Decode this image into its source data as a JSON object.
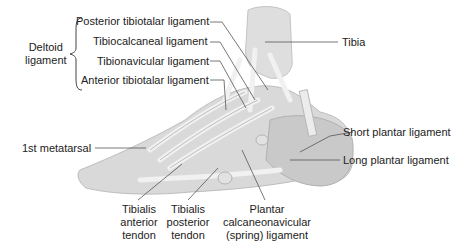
{
  "diagram": {
    "group_label": {
      "line1": "Deltoid",
      "line2": "ligament"
    },
    "deltoid_parts": [
      "Posterior tibiotalar ligament",
      "Tibiocalcaneal ligament",
      "Tibionavicular ligament",
      "Anterior tibiotalar ligament"
    ],
    "labels": {
      "tibia": "Tibia",
      "first_metatarsal": "1st metatarsal",
      "short_plantar": "Short plantar ligament",
      "long_plantar": "Long plantar ligament"
    },
    "bottom_labels": {
      "tib_ant": {
        "l1": "Tibialis",
        "l2": "anterior",
        "l3": "tendon"
      },
      "tib_post": {
        "l1": "Tibialis",
        "l2": "posterior",
        "l3": "tendon"
      },
      "spring": {
        "l1": "Plantar",
        "l2": "calcaneonavicular",
        "l3": "(spring) ligament"
      }
    },
    "colors": {
      "bone": "#d9d9d9",
      "bone_shade": "#b5b5b5",
      "ligament": "#eeeeee",
      "leader": "#555555",
      "text": "#222222"
    }
  }
}
